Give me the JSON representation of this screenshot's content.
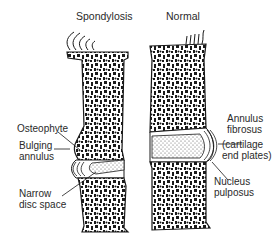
{
  "diagram": {
    "titles": {
      "left": "Spondylosis",
      "right": "Normal"
    },
    "labels_left": {
      "osteophyte": "Osteophyte",
      "bulging_annulus": [
        "Bulging",
        "annulus"
      ],
      "narrow_disc_space": [
        "Narrow",
        "disc space"
      ]
    },
    "labels_right": {
      "annulus_fibrosus": [
        "Annulus",
        "fibrosus"
      ],
      "cartilage": [
        "(cartilage",
        "end plates)"
      ],
      "nucleus_pulposus": [
        "Nucleus",
        "pulposus"
      ]
    },
    "colors": {
      "ink": "#1a1a1a",
      "text": "#2a2a2a",
      "background": "#ffffff"
    }
  }
}
